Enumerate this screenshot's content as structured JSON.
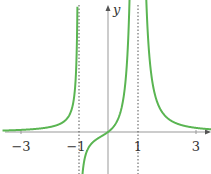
{
  "chart_data": {
    "type": "line",
    "title": "",
    "xlabel": "",
    "ylabel": "y",
    "xlim": [
      -3.6,
      3.6
    ],
    "x_ticks": [
      "-3",
      "-1",
      "1",
      "3"
    ],
    "asymptotes": [
      -1,
      1
    ],
    "grid": false,
    "legend": null,
    "series": [
      {
        "name": "f(x)",
        "color": "#5ab552",
        "description": "Curve with vertical asymptotes at x=-1 and x=1; positive for x<-1 rising to +inf, from -inf through origin to +inf on (-1,1), decreasing from +inf toward 0 for x>1",
        "x": [
          -3.5,
          -3,
          -2,
          -1.5,
          -1.2,
          0,
          1.5,
          2,
          3,
          3.5
        ],
        "y": [
          0.1,
          0.14,
          0.22,
          0.6,
          2.7,
          0,
          2.4,
          0.9,
          0.3,
          0.2
        ]
      }
    ]
  },
  "labels": {
    "y_axis": "y",
    "tick_m3": "−3",
    "tick_m1": "−1",
    "tick_1": "1",
    "tick_3": "3"
  }
}
